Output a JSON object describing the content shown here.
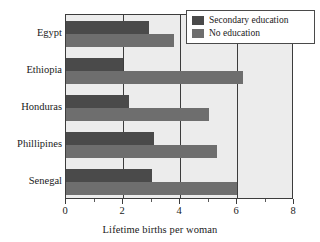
{
  "chart_data": {
    "type": "bar",
    "orientation": "horizontal",
    "title": "",
    "xlabel": "Lifetime births per woman",
    "ylabel": "",
    "xlim": [
      0,
      8
    ],
    "xticks": [
      0,
      2,
      4,
      6,
      8
    ],
    "xtick_labels": [
      "0",
      "2",
      "4",
      "6",
      "8"
    ],
    "minor_xticks": [
      1,
      3,
      5,
      7
    ],
    "grid": true,
    "grid_axis": "x",
    "legend_position": "top-right",
    "categories": [
      "Egypt",
      "Ethiopia",
      "Honduras",
      "Phillipines",
      "Senegal"
    ],
    "series": [
      {
        "name": "Secondary education",
        "color": "#4a4a4a",
        "values": [
          2.9,
          2.0,
          2.2,
          3.1,
          3.0
        ]
      },
      {
        "name": "No education",
        "color": "#6e6e6e",
        "values": [
          3.8,
          6.2,
          5.0,
          5.3,
          6.0
        ]
      }
    ]
  },
  "legend": {
    "items": [
      {
        "label": "Secondary education",
        "swatch": "secondary"
      },
      {
        "label": "No education",
        "swatch": "none"
      }
    ]
  },
  "colors": {
    "secondary_education": "#4a4a4a",
    "no_education": "#6e6e6e",
    "plot_background": "#ececec",
    "axis": "#3c3c3c",
    "page_background": "#ffffff"
  }
}
